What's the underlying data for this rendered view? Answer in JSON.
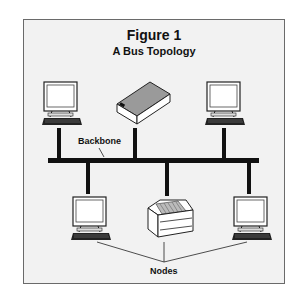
{
  "figure": {
    "title": "Figure 1",
    "subtitle": "A Bus Topology"
  },
  "labels": {
    "backbone": "Backbone",
    "nodes": "Nodes"
  },
  "devices": [
    {
      "type": "computer",
      "position": "top-left"
    },
    {
      "type": "server",
      "position": "top-center"
    },
    {
      "type": "computer",
      "position": "top-right"
    },
    {
      "type": "computer",
      "position": "bottom-left"
    },
    {
      "type": "printer",
      "position": "bottom-center"
    },
    {
      "type": "computer",
      "position": "bottom-right"
    }
  ],
  "colors": {
    "background": "#f2f2f2",
    "line": "#111111",
    "server_top": "#9a9a9a"
  }
}
